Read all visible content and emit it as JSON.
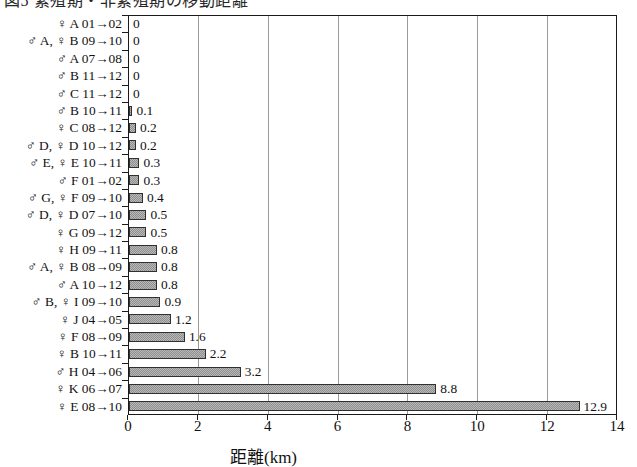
{
  "title_strip": {
    "text": "図5 繁殖期・非繁殖期の移動距離"
  },
  "chart_data": {
    "type": "bar",
    "orientation": "horizontal",
    "title": "",
    "xlabel": "距離(km)",
    "ylabel": "",
    "xlim": [
      0,
      14
    ],
    "xticks": [
      0,
      2,
      4,
      6,
      8,
      10,
      12,
      14
    ],
    "xtick_labels": [
      "0",
      "2",
      "4",
      "6",
      "8",
      "10",
      "12",
      "14"
    ],
    "grid": true,
    "grid_axis": "x",
    "legend": null,
    "bar_fill": "#b9b9b9",
    "bar_hatch": "dotted-gray",
    "bar_edge": "#303030",
    "categories": [
      "♀ A 01→02",
      "♂ A, ♀ B 09→10",
      "♂ A 07→08",
      "♂ B 11→12",
      "♂ C 11→12",
      "♂ B 10→11",
      "♀ C 08→12",
      "♂ D, ♀ D 10→12",
      "♂ E, ♀ E 10→11",
      "♂ F 01→02",
      "♂ G, ♀ F 09→10",
      "♂ D, ♀ D 07→10",
      "♀ G 09→12",
      "♀ H 09→11",
      "♂ A, ♀ B 08→09",
      "♂ A 10→12",
      "♂ B, ♀ I 09→10",
      "♀ J 04→05",
      "♀ F 08→09",
      "♀ B 10→11",
      "♂ H 04→06",
      "♀ K 06→07",
      "♀ E 08→10"
    ],
    "values": [
      0,
      0,
      0,
      0,
      0,
      0.1,
      0.2,
      0.2,
      0.3,
      0.3,
      0.4,
      0.5,
      0.5,
      0.8,
      0.8,
      0.8,
      0.9,
      1.2,
      1.6,
      2.2,
      3.2,
      8.8,
      12.9
    ],
    "value_labels": [
      "0",
      "0",
      "0",
      "0",
      "0",
      "0.1",
      "0.2",
      "0.2",
      "0.3",
      "0.3",
      "0.4",
      "0.5",
      "0.5",
      "0.8",
      "0.8",
      "0.8",
      "0.9",
      "1.2",
      "1.6",
      "2.2",
      "3.2",
      "8.8",
      "12.9"
    ]
  }
}
